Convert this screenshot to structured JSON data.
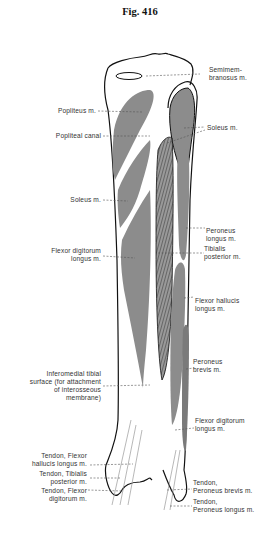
{
  "figure": {
    "title": "Fig. 416",
    "colors": {
      "muscle": "#8c8c8c",
      "outline": "#111111",
      "leader": "#555555",
      "text": "#333333"
    }
  },
  "labels_left": [
    {
      "id": "popliteus",
      "lines": [
        "Popliteus m."
      ]
    },
    {
      "id": "popliteal-canal",
      "lines": [
        "Popliteal canal"
      ]
    },
    {
      "id": "soleus-left",
      "lines": [
        "Soleus m."
      ]
    },
    {
      "id": "flexor-digitorum-longus-upper",
      "lines": [
        "Flexor digitorum",
        "longus m."
      ]
    },
    {
      "id": "inferomedial-tibial-surface",
      "lines": [
        "Inferomedial tibial",
        "surface (for attachment",
        "of interosseous",
        "membrane)"
      ]
    },
    {
      "id": "tendon-flexor-hallucis",
      "lines": [
        "Tendon, Flexor",
        "hallucis longus m."
      ]
    },
    {
      "id": "tendon-tibialis-posterior",
      "lines": [
        "Tendon, Tibialis",
        "posterior m."
      ]
    },
    {
      "id": "tendon-flexor-digitorum",
      "lines": [
        "Tendon, Flexor",
        "digitorum m."
      ]
    }
  ],
  "labels_right": [
    {
      "id": "semimembranosus",
      "lines": [
        "Semimem-",
        "branosus m."
      ]
    },
    {
      "id": "soleus-right",
      "lines": [
        "Soleus m."
      ]
    },
    {
      "id": "peroneus-longus",
      "lines": [
        "Peroneus",
        "longus m."
      ]
    },
    {
      "id": "tibialis-posterior",
      "lines": [
        "Tibialis",
        "posterior m."
      ]
    },
    {
      "id": "flexor-hallucis-longus",
      "lines": [
        "Flexor hallucis",
        "longus m."
      ]
    },
    {
      "id": "peroneus-brevis",
      "lines": [
        "Peroneus",
        "brevis m."
      ]
    },
    {
      "id": "flexor-digitorum-longus-lower",
      "lines": [
        "Flexor digitorum",
        "longus m."
      ]
    },
    {
      "id": "tendon-peroneus-brevis",
      "lines": [
        "Tendon,",
        "Peroneus brevis m."
      ]
    },
    {
      "id": "tendon-peroneus-longus",
      "lines": [
        "Tendon,",
        "Peroneus longus m."
      ]
    }
  ]
}
